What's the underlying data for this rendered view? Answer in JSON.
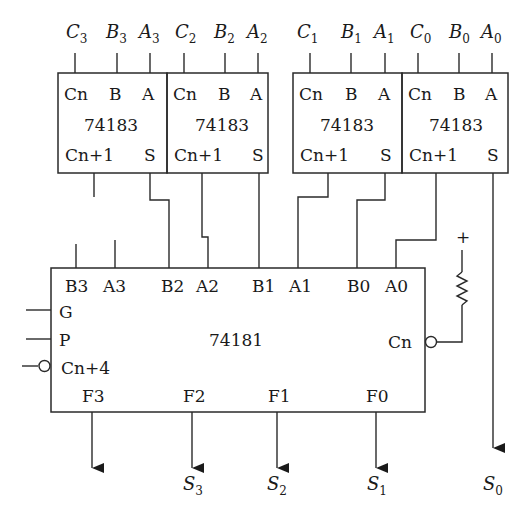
{
  "top_inputs": [
    {
      "letter": "C",
      "sub": "3"
    },
    {
      "letter": "B",
      "sub": "3"
    },
    {
      "letter": "A",
      "sub": "3"
    },
    {
      "letter": "C",
      "sub": "2"
    },
    {
      "letter": "B",
      "sub": "2"
    },
    {
      "letter": "A",
      "sub": "2"
    },
    {
      "letter": "C",
      "sub": "1"
    },
    {
      "letter": "B",
      "sub": "1"
    },
    {
      "letter": "A",
      "sub": "1"
    },
    {
      "letter": "C",
      "sub": "0"
    },
    {
      "letter": "B",
      "sub": "0"
    },
    {
      "letter": "A",
      "sub": "0"
    }
  ],
  "adders": [
    {
      "part": "74183",
      "pin_cn": "Cn",
      "pin_b": "B",
      "pin_a": "A",
      "pin_cout": "Cn+1",
      "pin_s": "S"
    },
    {
      "part": "74183",
      "pin_cn": "Cn",
      "pin_b": "B",
      "pin_a": "A",
      "pin_cout": "Cn+1",
      "pin_s": "S"
    },
    {
      "part": "74183",
      "pin_cn": "Cn",
      "pin_b": "B",
      "pin_a": "A",
      "pin_cout": "Cn+1",
      "pin_s": "S"
    },
    {
      "part": "74183",
      "pin_cn": "Cn",
      "pin_b": "B",
      "pin_a": "A",
      "pin_cout": "Cn+1",
      "pin_s": "S"
    }
  ],
  "alu": {
    "part": "74181",
    "top_pins": [
      "B3",
      "A3",
      "B2",
      "A2",
      "B1",
      "A1",
      "B0",
      "A0"
    ],
    "left_pins": [
      "G",
      "P",
      "Cn+4"
    ],
    "right_pin": "Cn",
    "bottom_pins": [
      "F3",
      "F2",
      "F1",
      "F0"
    ]
  },
  "pullup": {
    "symbol": "+"
  },
  "outputs": [
    {
      "letter": "S",
      "sub": "3"
    },
    {
      "letter": "S",
      "sub": "2"
    },
    {
      "letter": "S",
      "sub": "1"
    },
    {
      "letter": "S",
      "sub": "0"
    }
  ]
}
